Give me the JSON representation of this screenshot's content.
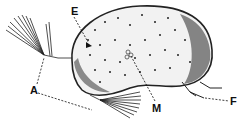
{
  "figure": {
    "labels": [
      {
        "id": "A",
        "text": "A",
        "x": 31,
        "y": 85
      },
      {
        "id": "E",
        "text": "E",
        "x": 71,
        "y": 8
      },
      {
        "id": "M",
        "text": "M",
        "x": 156,
        "y": 104
      },
      {
        "id": "F",
        "text": "F",
        "x": 231,
        "y": 97
      }
    ],
    "colors": {
      "ink": "#111111",
      "background": "#ffffff",
      "shell_fill": "#f2f2f2"
    }
  }
}
